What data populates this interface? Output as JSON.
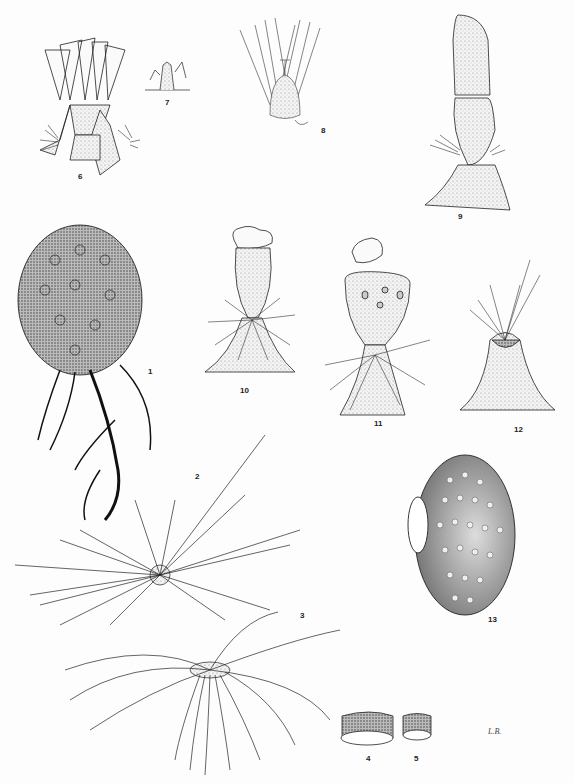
{
  "plate": {
    "type": "botanical illustration plate",
    "background": "#ffffff",
    "ink": "#1a1a1a",
    "signature": "L.B.",
    "figures": [
      {
        "n": "1",
        "label": "1",
        "subject": "globose cactus body with spine clusters and tap roots"
      },
      {
        "n": "2",
        "label": "2",
        "subject": "areole with radiating spines (top view)"
      },
      {
        "n": "3",
        "label": "3",
        "subject": "areole with curved spines (side view)"
      },
      {
        "n": "4",
        "label": "4",
        "subject": "spine cross-section cylinder (large)"
      },
      {
        "n": "5",
        "label": "5",
        "subject": "spine cross-section cylinder (small)"
      },
      {
        "n": "6",
        "label": "6",
        "subject": "flower on stem tubercles"
      },
      {
        "n": "7",
        "label": "7",
        "subject": "petal / perianth segment detail"
      },
      {
        "n": "8",
        "label": "8",
        "subject": "flower in longitudinal section"
      },
      {
        "n": "9",
        "label": "9",
        "subject": "fruit with persistent perianth"
      },
      {
        "n": "10",
        "label": "10",
        "subject": "fruit with operculum lifted"
      },
      {
        "n": "11",
        "label": "11",
        "subject": "dehisced fruit showing seeds, operculum detached"
      },
      {
        "n": "12",
        "label": "12",
        "subject": "tubercle with spines after fruit fall"
      },
      {
        "n": "13",
        "label": "13",
        "subject": "tuberculate seed with hilum"
      }
    ]
  }
}
